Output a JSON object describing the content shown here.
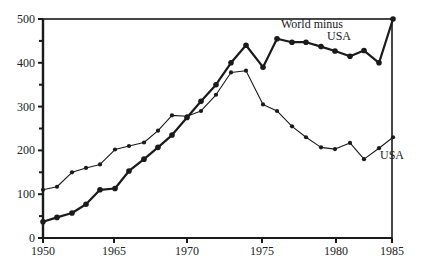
{
  "chart_data": {
    "type": "line",
    "title": "",
    "xlabel": "",
    "ylabel": "",
    "xlim": [
      1950,
      1985
    ],
    "ylim": [
      0,
      500
    ],
    "grid": false,
    "legend": "inline annotations",
    "x_ticks": [
      {
        "label": "1950",
        "px": 43
      },
      {
        "label": "1965",
        "px": 114
      },
      {
        "label": "1970",
        "px": 187
      },
      {
        "label": "1975",
        "px": 262
      },
      {
        "label": "1980",
        "px": 336
      },
      {
        "label": "1985",
        "px": 392
      }
    ],
    "y_ticks": [
      {
        "label": "0",
        "value": 0
      },
      {
        "label": "100",
        "value": 100
      },
      {
        "label": "200",
        "value": 200
      },
      {
        "label": "300",
        "value": 300
      },
      {
        "label": "400",
        "value": 400
      },
      {
        "label": "500",
        "value": 500
      }
    ],
    "y_minor_ticks": [
      50,
      150,
      250,
      350,
      450
    ],
    "series": [
      {
        "name": "World minus USA",
        "style": "thick",
        "x_px": [
          43,
          57,
          72,
          86,
          100,
          115,
          129,
          144,
          158,
          172,
          187,
          201,
          216,
          231,
          246,
          263,
          277,
          292,
          306,
          321,
          335,
          350,
          364,
          379,
          393
        ],
        "values": [
          37,
          47,
          57,
          77,
          110,
          113,
          153,
          180,
          207,
          235,
          275,
          312,
          350,
          400,
          440,
          390,
          455,
          447,
          447,
          437,
          427,
          415,
          428,
          400,
          500
        ]
      },
      {
        "name": "USA",
        "style": "thin",
        "x_px": [
          43,
          57,
          72,
          86,
          100,
          115,
          129,
          144,
          158,
          172,
          187,
          201,
          216,
          231,
          246,
          263,
          277,
          292,
          306,
          321,
          335,
          350,
          364,
          379,
          393
        ],
        "values": [
          110,
          117,
          150,
          160,
          168,
          202,
          210,
          218,
          245,
          280,
          278,
          290,
          327,
          378,
          382,
          305,
          290,
          255,
          230,
          207,
          203,
          217,
          180,
          205,
          230
        ]
      }
    ],
    "annotations": [
      {
        "text_lines": [
          "World minus",
          "USA"
        ],
        "series": "World minus USA"
      },
      {
        "text_lines": [
          "USA"
        ],
        "series": "USA"
      }
    ]
  },
  "labels": {
    "world_line1": "World minus",
    "world_line2": "USA",
    "usa": "USA"
  }
}
